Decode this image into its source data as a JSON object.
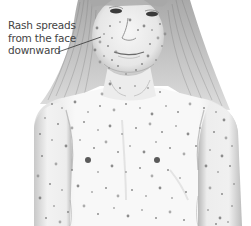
{
  "illustration": {
    "subject": "child with rash on face, neck, chest and arms",
    "style": "grayscale pencil medical illustration",
    "colors": {
      "background": "#ffffff",
      "skin": "#f4f4f4",
      "shade": "#bdbdbd",
      "hair": "#8a8a8a",
      "spots": "#7a7a7a",
      "text": "#444444"
    }
  },
  "annotation": {
    "lines": [
      "Rash spreads",
      "from the face",
      "downward"
    ],
    "leader_line": {
      "x1": 58,
      "y1": 52,
      "x2": 101,
      "y2": 37
    }
  },
  "spots": [
    [
      97,
      28
    ],
    [
      104,
      34
    ],
    [
      110,
      26
    ],
    [
      100,
      42
    ],
    [
      108,
      46
    ],
    [
      112,
      38
    ],
    [
      95,
      50
    ],
    [
      104,
      56
    ],
    [
      112,
      60
    ],
    [
      100,
      62
    ],
    [
      118,
      66
    ],
    [
      109,
      68
    ],
    [
      144,
      26
    ],
    [
      152,
      30
    ],
    [
      160,
      24
    ],
    [
      158,
      38
    ],
    [
      150,
      44
    ],
    [
      162,
      46
    ],
    [
      148,
      56
    ],
    [
      156,
      60
    ],
    [
      142,
      64
    ],
    [
      165,
      34
    ],
    [
      136,
      70
    ],
    [
      126,
      74
    ],
    [
      130,
      20
    ],
    [
      120,
      22
    ],
    [
      138,
      30
    ],
    [
      116,
      52
    ],
    [
      120,
      88
    ],
    [
      135,
      86
    ],
    [
      110,
      84
    ],
    [
      148,
      88
    ],
    [
      160,
      92
    ],
    [
      102,
      94
    ],
    [
      52,
      104
    ],
    [
      62,
      108
    ],
    [
      75,
      102
    ],
    [
      88,
      112
    ],
    [
      100,
      106
    ],
    [
      114,
      110
    ],
    [
      126,
      104
    ],
    [
      140,
      108
    ],
    [
      152,
      114
    ],
    [
      166,
      106
    ],
    [
      178,
      112
    ],
    [
      190,
      104
    ],
    [
      204,
      108
    ],
    [
      216,
      112
    ],
    [
      224,
      120
    ],
    [
      45,
      118
    ],
    [
      58,
      124
    ],
    [
      72,
      128
    ],
    [
      84,
      122
    ],
    [
      98,
      130
    ],
    [
      110,
      126
    ],
    [
      122,
      134
    ],
    [
      136,
      128
    ],
    [
      150,
      124
    ],
    [
      162,
      132
    ],
    [
      176,
      126
    ],
    [
      188,
      134
    ],
    [
      200,
      128
    ],
    [
      214,
      132
    ],
    [
      226,
      138
    ],
    [
      40,
      134
    ],
    [
      52,
      140
    ],
    [
      66,
      146
    ],
    [
      80,
      140
    ],
    [
      94,
      148
    ],
    [
      106,
      142
    ],
    [
      118,
      152
    ],
    [
      130,
      146
    ],
    [
      144,
      152
    ],
    [
      156,
      142
    ],
    [
      170,
      148
    ],
    [
      184,
      154
    ],
    [
      196,
      146
    ],
    [
      210,
      150
    ],
    [
      222,
      156
    ],
    [
      232,
      146
    ],
    [
      42,
      156
    ],
    [
      56,
      164
    ],
    [
      72,
      170
    ],
    [
      98,
      172
    ],
    [
      112,
      166
    ],
    [
      126,
      172
    ],
    [
      140,
      168
    ],
    [
      152,
      176
    ],
    [
      168,
      170
    ],
    [
      180,
      178
    ],
    [
      206,
      166
    ],
    [
      218,
      172
    ],
    [
      230,
      166
    ],
    [
      38,
      176
    ],
    [
      50,
      184
    ],
    [
      62,
      190
    ],
    [
      78,
      186
    ],
    [
      92,
      192
    ],
    [
      106,
      188
    ],
    [
      118,
      196
    ],
    [
      132,
      190
    ],
    [
      146,
      196
    ],
    [
      160,
      188
    ],
    [
      172,
      198
    ],
    [
      186,
      192
    ],
    [
      210,
      188
    ],
    [
      222,
      194
    ],
    [
      234,
      184
    ],
    [
      40,
      198
    ],
    [
      54,
      206
    ],
    [
      68,
      212
    ],
    [
      84,
      206
    ],
    [
      98,
      214
    ],
    [
      114,
      208
    ],
    [
      128,
      216
    ],
    [
      142,
      210
    ],
    [
      156,
      218
    ],
    [
      170,
      212
    ],
    [
      184,
      220
    ],
    [
      208,
      210
    ],
    [
      220,
      218
    ],
    [
      232,
      206
    ],
    [
      46,
      218
    ],
    [
      60,
      222
    ],
    [
      216,
      224
    ],
    [
      228,
      222
    ]
  ]
}
